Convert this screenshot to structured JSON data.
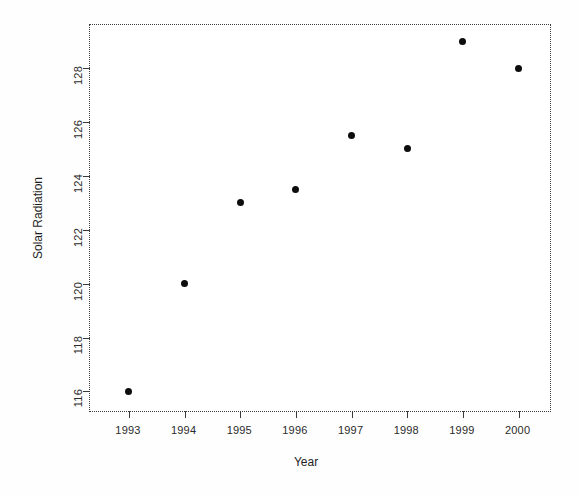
{
  "chart_data": {
    "type": "scatter",
    "title": "",
    "xlabel": "Year",
    "ylabel": "Solar Radiation",
    "x": [
      1993,
      1994,
      1995,
      1996,
      1997,
      1998,
      1999,
      2000
    ],
    "values": [
      116,
      120,
      123,
      123.5,
      125.5,
      125,
      129,
      128
    ],
    "categories": [
      "1993",
      "1994",
      "1995",
      "1996",
      "1997",
      "1998",
      "1999",
      "2000"
    ],
    "series": [
      {
        "name": "Solar Radiation",
        "values": [
          116,
          120,
          123,
          123.5,
          125.5,
          125,
          129,
          128
        ]
      }
    ],
    "points": [
      {
        "x": 1993,
        "y": 116
      },
      {
        "x": 1994,
        "y": 120
      },
      {
        "x": 1995,
        "y": 123
      },
      {
        "x": 1996,
        "y": 123.5
      },
      {
        "x": 1997,
        "y": 125.5
      },
      {
        "x": 1998,
        "y": 125
      },
      {
        "x": 1999,
        "y": 129
      },
      {
        "x": 2000,
        "y": 128
      }
    ],
    "xlim": [
      1992.3,
      2000.6
    ],
    "ylim": [
      115.2,
      129.6
    ],
    "xticks": [
      1993,
      1994,
      1995,
      1996,
      1997,
      1998,
      1999,
      2000
    ],
    "xticklabels": [
      "1993",
      "1994",
      "1995",
      "1996",
      "1997",
      "1998",
      "1999",
      "2000"
    ],
    "yticks": [
      116,
      118,
      120,
      122,
      124,
      126,
      128
    ],
    "yticklabels": [
      "116",
      "118",
      "120",
      "122",
      "124",
      "126",
      "128"
    ],
    "grid": false,
    "legend": false,
    "legend_position": "none",
    "marker": "filled-circle",
    "marker_color": "#0d0d0d",
    "frame_color": "#3a3a3a",
    "background_color": "#ffffff"
  }
}
